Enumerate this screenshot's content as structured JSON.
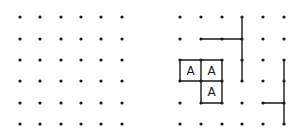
{
  "colors": {
    "ink": "#1a1a1a",
    "background": "#ffffff"
  },
  "left_grid": {
    "cols": 6,
    "rows": 6,
    "xs": [
      20,
      40,
      61,
      81,
      101,
      122
    ],
    "ys": [
      17,
      39,
      60,
      81,
      103,
      124
    ]
  },
  "right_grid": {
    "cols": 6,
    "rows": 6,
    "xs": [
      180,
      201,
      222,
      242,
      263,
      284
    ],
    "ys": [
      17,
      39,
      60,
      81,
      103,
      124
    ],
    "segments": [
      {
        "from": [
          3,
          0
        ],
        "to": [
          3,
          3
        ]
      },
      {
        "from": [
          1,
          1
        ],
        "to": [
          3,
          1
        ]
      },
      {
        "from": [
          0,
          2
        ],
        "to": [
          2,
          2
        ]
      },
      {
        "from": [
          0,
          3
        ],
        "to": [
          2,
          3
        ]
      },
      {
        "from": [
          0,
          2
        ],
        "to": [
          0,
          3
        ]
      },
      {
        "from": [
          1,
          2
        ],
        "to": [
          1,
          4
        ]
      },
      {
        "from": [
          2,
          2
        ],
        "to": [
          2,
          4
        ]
      },
      {
        "from": [
          1,
          4
        ],
        "to": [
          2,
          4
        ]
      },
      {
        "from": [
          5,
          2
        ],
        "to": [
          5,
          5
        ]
      },
      {
        "from": [
          4,
          4
        ],
        "to": [
          5,
          4
        ]
      }
    ],
    "boxes": [
      {
        "col": 0,
        "row": 2,
        "label": "A"
      },
      {
        "col": 1,
        "row": 2,
        "label": "A"
      },
      {
        "col": 1,
        "row": 3,
        "label": "A"
      }
    ]
  }
}
